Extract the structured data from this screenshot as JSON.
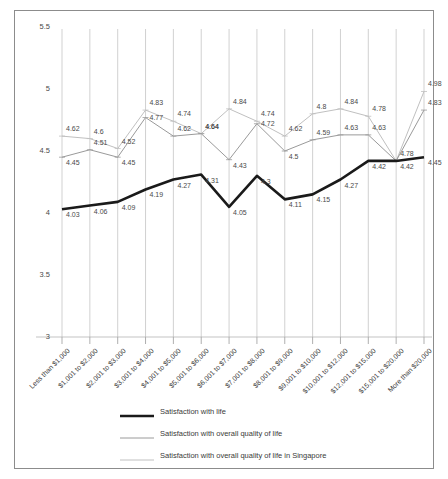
{
  "chart_data": {
    "type": "line",
    "title": "",
    "xlabel": "",
    "ylabel": "",
    "ylim": [
      3,
      5.5
    ],
    "yticks": [
      "3",
      "3.5",
      "4",
      "4.5",
      "5",
      "5.5"
    ],
    "grid": "vertical",
    "legend_position": "bottom",
    "categories": [
      "Less than $1,000",
      "$1,001 to $2,000",
      "$2,001 to $3,000",
      "$3,001 to $4,000",
      "$4,001 to $5,000",
      "$5,001 to $6,000",
      "$6,001 to $7,000",
      "$7,001 to $8,000",
      "$8,001 to $9,000",
      "$9,001 to $10,000",
      "$10,001 to $12,000",
      "$12,001 to $15,000",
      "$15,001 to $20,000",
      "More than $20,000"
    ],
    "series": [
      {
        "name": "Satisfaction with life",
        "color": "#1a1a1a",
        "width": 2.6,
        "values": [
          4.03,
          4.06,
          4.09,
          4.19,
          4.27,
          4.31,
          4.05,
          4.3,
          4.11,
          4.15,
          4.27,
          4.42,
          4.42,
          4.45
        ],
        "labels": [
          "4.03",
          "4.06",
          "4.09",
          "4.19",
          "4.27",
          "4.31",
          "4.05",
          "4.3",
          "4.11",
          "4.15",
          "4.27",
          "4.42",
          "4.42",
          "4.45"
        ]
      },
      {
        "name": "Satisfaction with overall quality of life",
        "color": "#9a9a9a",
        "width": 1.0,
        "values": [
          4.45,
          4.51,
          4.45,
          4.77,
          4.62,
          4.64,
          4.43,
          4.72,
          4.5,
          4.59,
          4.63,
          4.63,
          4.42,
          4.83
        ],
        "labels": [
          "4.45",
          "4.51",
          "4.45",
          "4.77",
          "4.62",
          "4.64",
          "4.43",
          "4.72",
          "4.5",
          "4.59",
          "4.63",
          "4.63",
          "",
          "4.83"
        ]
      },
      {
        "name": "Satisfaction with overall quality of life in Singapore",
        "color": "#c0c0c0",
        "width": 1.0,
        "values": [
          4.62,
          4.6,
          4.52,
          4.83,
          4.74,
          4.64,
          4.84,
          4.74,
          4.62,
          4.8,
          4.84,
          4.78,
          4.42,
          4.98
        ],
        "labels": [
          "4.62",
          "4.6",
          "4.52",
          "4.83",
          "4.74",
          "4.64",
          "4.84",
          "4.74",
          "4.62",
          "4.8",
          "4.84",
          "4.78",
          "4.78",
          "4.98"
        ]
      }
    ]
  },
  "legend": {
    "items": [
      {
        "label": "Satisfaction with life",
        "color": "#1a1a1a",
        "width": 2.6
      },
      {
        "label": "Satisfaction with overall quality of life",
        "color": "#9a9a9a",
        "width": 1.0
      },
      {
        "label": "Satisfaction with overall quality of life in Singapore",
        "color": "#c0c0c0",
        "width": 1.0
      }
    ]
  }
}
